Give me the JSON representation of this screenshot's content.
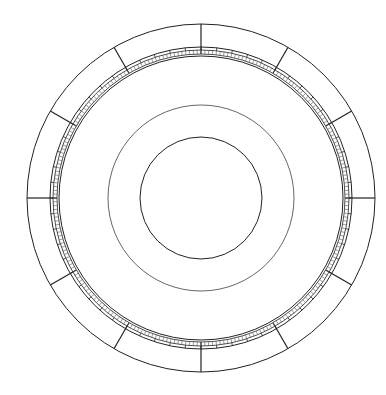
{
  "diagram": {
    "type": "concentric-circular-dial",
    "center": [
      201,
      198
    ],
    "colors": {
      "stroke": "#222222",
      "fine_stroke": "#555555",
      "background": "#ffffff"
    },
    "rings": {
      "outer_radius": 174,
      "band_outer_radius": 151,
      "band_mid_radius": 148,
      "tick_inner_radius": 144,
      "band_inner_radius": 142,
      "middle_circle_radius": 93,
      "inner_circle_radius": 61
    },
    "spokes": {
      "count": 12,
      "start_angle_deg": 0
    },
    "band_subdivisions": {
      "count": 60
    },
    "fine_ticks": {
      "count": 240
    }
  }
}
